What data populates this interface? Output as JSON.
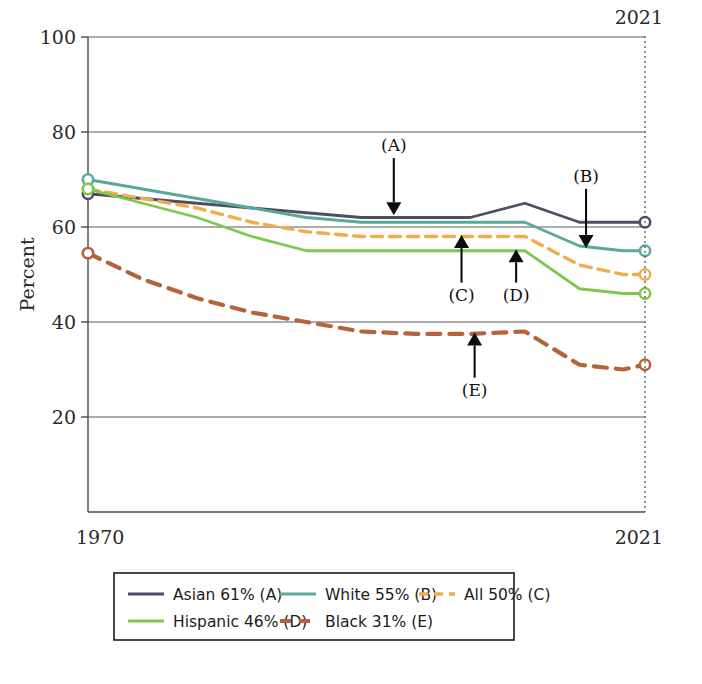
{
  "chart_data": {
    "type": "line",
    "title": "",
    "xlabel": "",
    "ylabel": "Percent",
    "xlim": [
      1970,
      2021
    ],
    "ylim": [
      0,
      100
    ],
    "yticks": [
      20,
      40,
      60,
      80,
      100
    ],
    "xticks": [
      1970,
      2021
    ],
    "xtick_labels": [
      "1970",
      "2021"
    ],
    "ytick_labels": [
      "20",
      "40",
      "60",
      "80",
      "100"
    ],
    "grid": "horizontal",
    "legend_position": "bottom",
    "reference_line": {
      "x": 2021,
      "label": "2021",
      "style": "dashed"
    },
    "x": [
      1970,
      1975,
      1980,
      1985,
      1990,
      1995,
      2000,
      2005,
      2010,
      2015,
      2019,
      2021
    ],
    "series": [
      {
        "name": "Asian",
        "label": "Asian 61% (A)",
        "key": "A",
        "color": "#4c4f63",
        "style": "solid",
        "end_value": 61,
        "values": [
          67,
          66,
          65,
          64,
          63,
          62,
          62,
          62,
          65,
          61,
          61,
          61
        ]
      },
      {
        "name": "White",
        "label": "White 55% (B)",
        "key": "B",
        "color": "#5aa79b",
        "style": "solid",
        "end_value": 55,
        "values": [
          70,
          68,
          66,
          64,
          62,
          61,
          61,
          61,
          61,
          56,
          55,
          55
        ]
      },
      {
        "name": "All",
        "label": "All 50% (C)",
        "key": "C",
        "color": "#f0ad4e",
        "style": "dashed",
        "end_value": 50,
        "values": [
          68,
          66,
          64,
          61,
          59,
          58,
          58,
          58,
          58,
          52,
          50,
          50
        ]
      },
      {
        "name": "Hispanic",
        "label": "Hispanic 46% (D)",
        "key": "D",
        "color": "#7ec850",
        "style": "solid",
        "end_value": 46,
        "values": [
          68,
          65,
          62,
          58,
          55,
          55,
          55,
          55,
          55,
          47,
          46,
          46
        ]
      },
      {
        "name": "Black",
        "label": "Black 31% (E)",
        "key": "E",
        "color": "#b5633a",
        "style": "dashed-bold",
        "end_value": 31,
        "values": [
          54.5,
          49,
          45,
          42,
          40,
          38,
          37.5,
          37.5,
          38,
          31,
          30,
          31
        ]
      }
    ],
    "annotations": [
      {
        "label": "(A)",
        "series": "Asian",
        "direction": "down",
        "x": 1998,
        "tip_y": 62.5,
        "text_x": 1998,
        "text_y": 76
      },
      {
        "label": "(B)",
        "series": "White",
        "direction": "down",
        "x": 2015.6,
        "tip_y": 55.6,
        "text_x": 2015.6,
        "text_y": 69.5
      },
      {
        "label": "(C)",
        "series": "All",
        "direction": "up",
        "x": 2004.2,
        "tip_y": 58.3,
        "text_x": 2004.2,
        "text_y": 44.5
      },
      {
        "label": "(D)",
        "series": "Hispanic",
        "direction": "up",
        "x": 2009.2,
        "tip_y": 55.3,
        "text_x": 2009.2,
        "text_y": 44.5
      },
      {
        "label": "(E)",
        "series": "Black",
        "direction": "up",
        "x": 2005.4,
        "tip_y": 37.8,
        "text_x": 2005.4,
        "text_y": 24.5
      }
    ],
    "legend": {
      "rows": [
        [
          "Asian 61% (A)",
          "White 55% (B)",
          "All 50% (C)"
        ],
        [
          "Hispanic 46% (D)",
          "Black 31% (E)"
        ]
      ]
    }
  }
}
